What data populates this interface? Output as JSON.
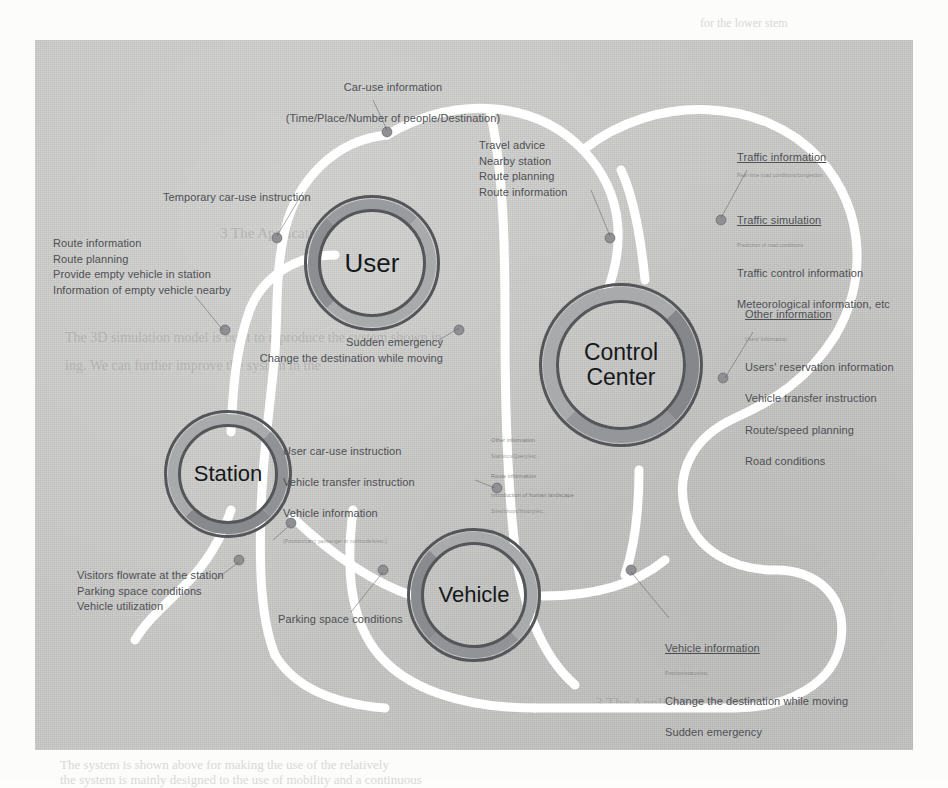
{
  "figure": {
    "background_color": "#c9c9c7",
    "connector_color": "#ffffff",
    "node_stroke_color": "#55565a",
    "node_band_color": "#a9aaac",
    "node_band_accent_color": "#8d8e91",
    "dot_color": "#8e9094"
  },
  "nodes": [
    {
      "id": "user",
      "label": "User"
    },
    {
      "id": "control-center",
      "label": "Control\nCenter"
    },
    {
      "id": "station",
      "label": "Station"
    },
    {
      "id": "vehicle",
      "label": "Vehicle"
    }
  ],
  "labels": {
    "car_use_information": {
      "line1": "Car-use information",
      "line2": "(Time/Place/Number of people/Destination)"
    },
    "travel_advice": {
      "lines": "Travel advice\nNearby station\nRoute planning\nRoute information"
    },
    "traffic_information": {
      "head": "Traffic information",
      "head_sub": "Real-time road conditions/congestion",
      "line2": "Traffic simulation",
      "line2_sub": "Prediction of road conditions",
      "line3": "Traffic control information",
      "line4": "Meteorological information, etc"
    },
    "temporary_car_use": {
      "text": "Temporary car-use instruction"
    },
    "route_information_left": {
      "lines": "Route information\nRoute planning\nProvide empty vehicle in station\nInformation of empty vehicle nearby"
    },
    "other_information_right": {
      "head": "Other information",
      "head_sub": "Users' information",
      "line2": "Users' reservation information",
      "line3": "Vehicle transfer instruction",
      "line4": "Route/speed planning",
      "line5": "Road conditions"
    },
    "sudden_emergency_user": {
      "lines": "Sudden emergency\nChange the destination while moving"
    },
    "user_car_use_instruction": {
      "line1": "User car-use instruction",
      "line2": "Vehicle transfer instruction",
      "line3": "Vehicle information",
      "line3_sub": "(Position/carry passenger or not/models/etc.)"
    },
    "other_information_small": {
      "line1": "Other information",
      "line1_sub": "Statistics/Query/etc.",
      "line2": "Route information",
      "line3": "Introduction of human landscape",
      "line3_sub": "Sites/shops/history/etc."
    },
    "visitors_flowrate": {
      "lines": "Visitors flowrate at the station\nParking space conditions\nVehicle utilization"
    },
    "parking_space_conditions": {
      "text": "Parking space conditions"
    },
    "vehicle_information_bottom": {
      "head": "Vehicle information",
      "head_sub": "Position/status/etc.",
      "line2": "Change the destination while moving",
      "line3": "Sudden emergency"
    }
  },
  "background_page_text": {
    "line_right_top": "for the lower stem",
    "line_mid_left": "The 3D simulation model is built to reproduce the system shown in",
    "line_mid_left2": "ing. We can further improve the system in the",
    "line_section": "3  The Application",
    "line_bottom1": "The system is shown above for making the use of the relatively",
    "line_bottom2": "the system is mainly designed to the use of mobility and a continuous"
  }
}
